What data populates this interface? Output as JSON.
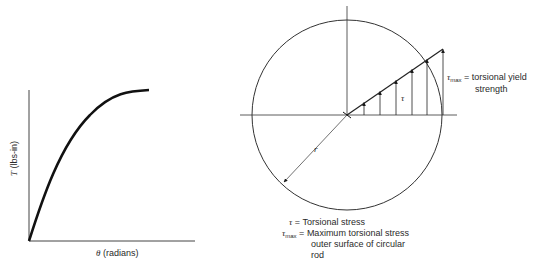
{
  "left_plot": {
    "y_axis": {
      "symbol": "T",
      "unit": "(lbs-in)"
    },
    "x_axis": {
      "symbol": "θ",
      "unit": "(radians)"
    },
    "curve": "torque-vs-angle, rising then saturating"
  },
  "circle_diagram": {
    "shear_symbol": "τ",
    "radius_symbol": "r",
    "tau_max_symbol": "τ",
    "tau_max_sub": "max",
    "tau_max_annotation": "= torsional yield",
    "tau_max_annotation_line2": "strength"
  },
  "legend": [
    {
      "symbol": "τ",
      "sub": "",
      "eq": "=",
      "text": "Torsional stress"
    },
    {
      "symbol": "τ",
      "sub": "max",
      "eq": "=",
      "text": "Maximum torsional stress"
    },
    {
      "text": "outer surface of circular"
    },
    {
      "text": "rod"
    }
  ],
  "colors": {
    "line": "#1a1a1a",
    "text": "#2a2a2a",
    "background": "#ffffff"
  }
}
